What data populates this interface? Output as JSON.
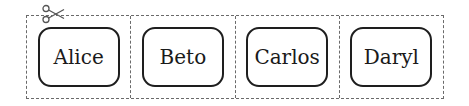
{
  "diagram": {
    "cutout_icon": "scissors-icon",
    "cards": [
      {
        "label": "Alice"
      },
      {
        "label": "Beto"
      },
      {
        "label": "Carlos"
      },
      {
        "label": "Daryl"
      }
    ],
    "colors": {
      "card_border": "#1e1e1e",
      "dashed_line": "#6a6a6a",
      "text": "#1a1a1a"
    }
  }
}
